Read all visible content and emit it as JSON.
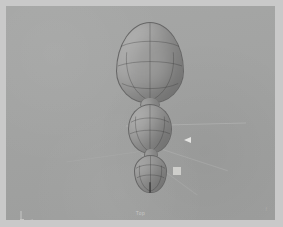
{
  "app": {
    "viewport_label": "Top",
    "status_glyph": "f"
  },
  "scene": {
    "background_color": "#a2a3a2",
    "frame_color": "#c9c9c9",
    "mesh_surface_color": "#9a9a99",
    "wireframe_color": "#373737",
    "objects": [
      {
        "id": "egg-large",
        "name": "Egg (Large)",
        "type": "egg",
        "x": 110,
        "y": 16,
        "width": 68,
        "height": 82,
        "meridians": 1,
        "latitudes": 3
      },
      {
        "id": "ellipsoid-mid",
        "name": "Ellipsoid (Medium)",
        "type": "ellipsoid",
        "x": 122,
        "y": 98,
        "width": 44,
        "height": 50,
        "meridians": 1,
        "latitudes": 2
      },
      {
        "id": "teardrop-small",
        "name": "Teardrop (Small)",
        "type": "teardrop",
        "x": 128,
        "y": 149,
        "width": 33,
        "height": 38,
        "meridians": 1,
        "latitudes": 2
      }
    ]
  },
  "hud": {
    "move_arrow_color": "#e8e8e6",
    "handle_square_color": "#d7d7d4",
    "axis_gizmo": {
      "x_label": "x",
      "y_label": "y",
      "z_label": "z"
    }
  }
}
